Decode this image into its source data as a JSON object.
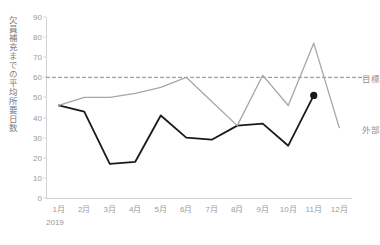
{
  "chart_data": {
    "type": "line",
    "title": "",
    "xlabel": "",
    "ylabel": "欠員補充までの平均所要日数",
    "x_group_label": "2019",
    "categories": [
      "1月",
      "2月",
      "3月",
      "4月",
      "5月",
      "6月",
      "7月",
      "8月",
      "9月",
      "10月",
      "11月",
      "12月"
    ],
    "ylim": [
      0,
      90
    ],
    "yticks": [
      0,
      10,
      20,
      30,
      40,
      50,
      60,
      70,
      80,
      90
    ],
    "grid": false,
    "legend_position": "right-inline",
    "series": [
      {
        "name": "内部",
        "label": "",
        "color": "#1a1a1a",
        "style": "solid",
        "marker_last": true,
        "values": [
          46,
          43,
          17,
          18,
          41,
          30,
          29,
          36,
          37,
          26,
          51,
          null
        ]
      },
      {
        "name": "外部",
        "label": "外部",
        "color": "#a6a6a6",
        "style": "solid",
        "marker_last": false,
        "values": [
          46,
          50,
          50,
          52,
          55,
          60,
          48,
          36,
          61,
          46,
          77,
          35
        ]
      }
    ],
    "reference_line": {
      "name": "目標",
      "label": "目標",
      "value": 60,
      "color": "#8c8c8c",
      "style": "dashed"
    }
  }
}
